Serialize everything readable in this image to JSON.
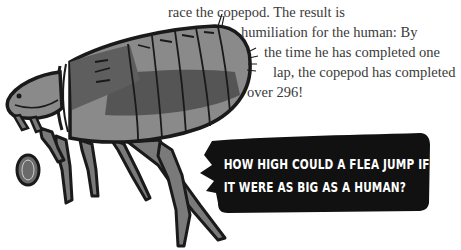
{
  "body_text": {
    "lines": [
      "race the copepod. The result is",
      "humiliation for the human: By",
      "the time he has completed one",
      "lap, the copepod has completed",
      "over 296!"
    ]
  },
  "illustration": {
    "subject": "flea-illustration",
    "colors": {
      "outline": "#1a1a1a",
      "body_light": "#8a8a8a",
      "body_mid": "#6e6e6e",
      "body_dark": "#4a4a4a",
      "leg": "#7a7a7a"
    }
  },
  "speech_bubble": {
    "lines": [
      "HOW HIGH COULD A FLEA JUMP IF",
      "IT WERE AS BIG AS A HUMAN?"
    ],
    "background": "#111111",
    "text_color": "#ffffff"
  }
}
